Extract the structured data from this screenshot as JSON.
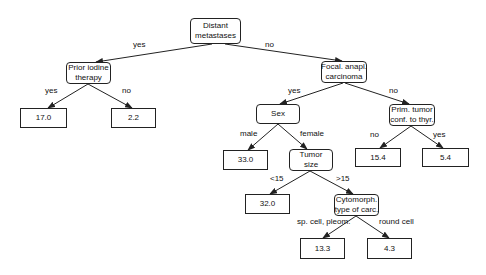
{
  "diagram": {
    "type": "regression-tree",
    "nodes": {
      "root": {
        "lines": [
          "Distant",
          "metastases"
        ],
        "kind": "decision"
      },
      "prior_iodine": {
        "lines": [
          "Prior iodine",
          "therapy"
        ],
        "kind": "decision"
      },
      "leaf_17_0": {
        "value": "17.0",
        "kind": "leaf"
      },
      "leaf_2_2": {
        "value": "2.2",
        "kind": "leaf"
      },
      "focal_anapl": {
        "lines": [
          "Focal. anapl.",
          "carcinoma"
        ],
        "kind": "decision"
      },
      "sex": {
        "lines": [
          "Sex"
        ],
        "kind": "decision"
      },
      "prim_tumor": {
        "lines": [
          "Prim. tumor",
          "conf. to thyr."
        ],
        "kind": "decision"
      },
      "leaf_33_0": {
        "value": "33.0",
        "kind": "leaf"
      },
      "tumor_size": {
        "lines": [
          "Tumor",
          "size"
        ],
        "kind": "decision"
      },
      "leaf_15_4": {
        "value": "15.4",
        "kind": "leaf"
      },
      "leaf_5_4": {
        "value": "5.4",
        "kind": "leaf"
      },
      "leaf_32_0": {
        "value": "32.0",
        "kind": "leaf"
      },
      "cytomorph": {
        "lines": [
          "Cytomorph.",
          "type of carc."
        ],
        "kind": "decision"
      },
      "leaf_13_3": {
        "value": "13.3",
        "kind": "leaf"
      },
      "leaf_4_3": {
        "value": "4.3",
        "kind": "leaf"
      }
    },
    "edges": {
      "root_prior": {
        "label": "yes"
      },
      "root_focal": {
        "label": "no"
      },
      "prior_17": {
        "label": "yes"
      },
      "prior_22": {
        "label": "no"
      },
      "focal_sex": {
        "label": "yes"
      },
      "focal_prim": {
        "label": "no"
      },
      "sex_33": {
        "label": "male"
      },
      "sex_tumor": {
        "label": "female"
      },
      "prim_154": {
        "label": "no"
      },
      "prim_54": {
        "label": "yes"
      },
      "tumor_32": {
        "label": "<15"
      },
      "tumor_cyto": {
        "label": ">15"
      },
      "cyto_133": {
        "label": "sp. cell, pleom."
      },
      "cyto_43": {
        "label": "round cell"
      }
    },
    "colors": {
      "line": "#222222",
      "background": "#ffffff",
      "text": "#111111"
    }
  }
}
